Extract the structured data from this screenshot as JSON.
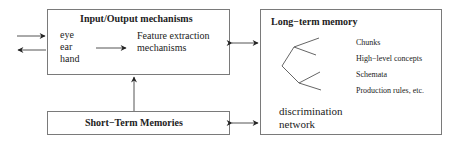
{
  "diagram": {
    "io_box": {
      "title": "Input/Output mechanisms",
      "senses": [
        "eye",
        "ear",
        "hand"
      ],
      "feature_line1": "Feature extraction",
      "feature_line2": "mechanisms"
    },
    "stm_box": {
      "title": "Short−Term Memories"
    },
    "ltm_box": {
      "title": "Long−term memory",
      "items": [
        "Chunks",
        "High−level concepts",
        "Schemata",
        "Production rules, etc."
      ],
      "network_line1": "discrimination",
      "network_line2": "network"
    },
    "colors": {
      "line": "#7a7a7a",
      "arrow": "#222222",
      "text": "#222222"
    }
  }
}
